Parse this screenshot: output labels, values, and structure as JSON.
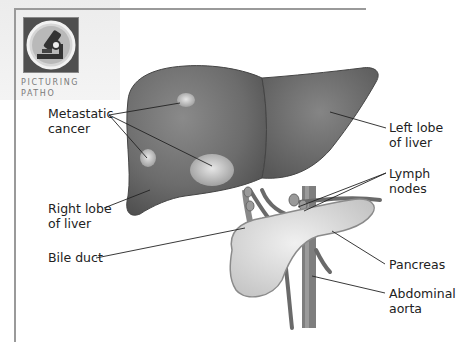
{
  "badge": {
    "icon": "microscope-icon",
    "caption_line1": "PICTURING",
    "caption_line2": "PATHO"
  },
  "labels": {
    "metastatic": {
      "line1": "Metastatic",
      "line2": "cancer"
    },
    "right_lobe": {
      "line1": "Right lobe",
      "line2": "of liver"
    },
    "bile_duct": {
      "line1": "Bile duct"
    },
    "left_lobe": {
      "line1": "Left lobe",
      "line2": "of liver"
    },
    "lymph_nodes": {
      "line1": "Lymph",
      "line2": "nodes"
    },
    "pancreas": {
      "line1": "Pancreas"
    },
    "aorta": {
      "line1": "Abdominal",
      "line2": "aorta"
    }
  },
  "colors": {
    "liver": "#6f6f6f",
    "tumor": "#c9c9c9",
    "pancreas": "#e2e2e2",
    "vessel": "#7c7c7c",
    "frame": "#9a9a9a"
  }
}
